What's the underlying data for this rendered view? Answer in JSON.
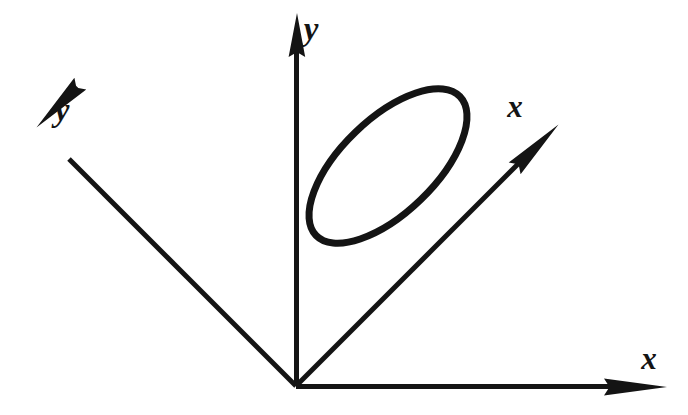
{
  "figure": {
    "background_color": "#ffffff",
    "ink_color": "#141414",
    "width": 688,
    "height": 415
  },
  "labels": {
    "y_vertical": "y",
    "y_rotated": "y",
    "x_rotated": "x",
    "x_horizontal": "x"
  },
  "chart_data": {
    "type": "diagram",
    "origin": {
      "x": 296,
      "y": 386
    },
    "axes": [
      {
        "name": "y-vertical",
        "label": "y",
        "from": {
          "x": 296,
          "y": 386
        },
        "to": {
          "x": 297,
          "y": 14
        },
        "arrow": "tip",
        "angle_deg": 90,
        "label_position": {
          "x": 313,
          "y": 33
        }
      },
      {
        "name": "x-horizontal",
        "label": "x",
        "from": {
          "x": 296,
          "y": 386
        },
        "to": {
          "x": 666,
          "y": 387
        },
        "arrow": "tip",
        "angle_deg": 0,
        "label_position": {
          "x": 650,
          "y": 362
        }
      },
      {
        "name": "y-rotated",
        "label": "y",
        "from": {
          "x": 296,
          "y": 386
        },
        "to": {
          "x": 37,
          "y": 127
        },
        "arrow": "tip",
        "angle_deg": 135,
        "label_position": {
          "x": 64,
          "y": 114
        }
      },
      {
        "name": "x-rotated",
        "label": "x",
        "from": {
          "x": 296,
          "y": 386
        },
        "to": {
          "x": 558,
          "y": 127
        },
        "arrow": "tip",
        "angle_deg": 45,
        "label_position": {
          "x": 516,
          "y": 110
        }
      }
    ],
    "shapes": [
      {
        "name": "ellipse",
        "type": "ellipse",
        "center": {
          "x": 388,
          "y": 166
        },
        "semi_major": 100,
        "semi_minor": 47,
        "rotation_deg": -44,
        "stroke_width": 7,
        "fill": "none"
      }
    ],
    "xlabel": "x",
    "ylabel": "y",
    "grid": false,
    "legend": false
  }
}
